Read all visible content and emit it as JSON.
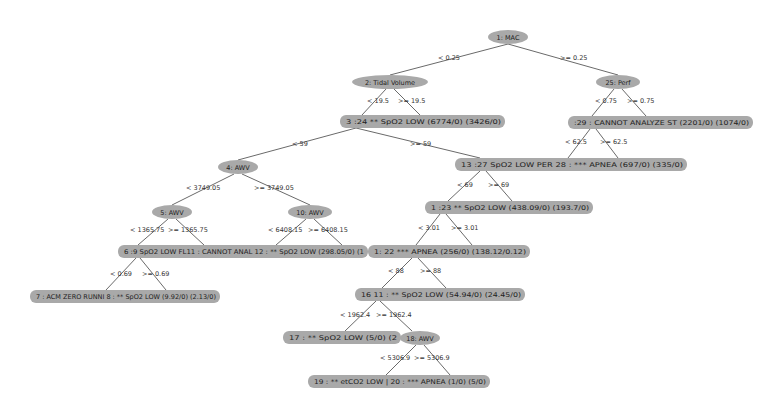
{
  "colors": {
    "node_fill": "#a9a9a9",
    "edge": "#6a6a6a",
    "background": "#ffffff"
  },
  "tree": {
    "internal_nodes": [
      {
        "id": "n1",
        "label": "1: MAC",
        "cx": 508,
        "cy": 37,
        "rx": 20,
        "ry": 7
      },
      {
        "id": "n2",
        "label": "2: Tidal Volume",
        "cx": 390,
        "cy": 82,
        "rx": 38,
        "ry": 7
      },
      {
        "id": "n25",
        "label": "25: Perf",
        "cx": 618,
        "cy": 82,
        "rx": 22,
        "ry": 7
      },
      {
        "id": "n4",
        "label": "4: AWV",
        "cx": 238,
        "cy": 167,
        "rx": 20,
        "ry": 7
      },
      {
        "id": "n5",
        "label": "5: AWV",
        "cx": 172,
        "cy": 212,
        "rx": 20,
        "ry": 7
      },
      {
        "id": "n10",
        "label": "10: AWV",
        "cx": 310,
        "cy": 212,
        "rx": 22,
        "ry": 7
      },
      {
        "id": "n18",
        "label": "18: AWV",
        "cx": 420,
        "cy": 338,
        "rx": 20,
        "ry": 7
      }
    ],
    "leaf_bars": [
      {
        "id": "b3",
        "text": "3  :24  ** SpO2    LOW        (6774/0) (3426/0)",
        "x": 340,
        "y": 115,
        "w": 165,
        "h": 13
      },
      {
        "id": "b29",
        "text": ":29 : CANNOT ANALYZE ST   (2201/0) (1074/0)",
        "x": 568,
        "y": 116,
        "w": 185,
        "h": 13
      },
      {
        "id": "b13",
        "text": "13  :27  SpO2    LOW PER 28 : *** APNEA         (697/0) (335/0)",
        "x": 455,
        "y": 158,
        "w": 232,
        "h": 13
      },
      {
        "id": "b23",
        "text": "1  :23  ** SpO2    LOW        (438.09/0) (193.7/0)",
        "x": 425,
        "y": 201,
        "w": 168,
        "h": 13
      },
      {
        "id": "b6",
        "text": "6  :9  SpO2   LOW FL11 : CANNOT ANAL 12 : ** SpO2   LOW      (298.05/0) (1",
        "x": 118,
        "y": 245,
        "w": 250,
        "h": 13
      },
      {
        "id": "b21",
        "text": "1: 22  *** APNEA             (256/0) (138.12/0.12)",
        "x": 368,
        "y": 245,
        "w": 162,
        "h": 13
      },
      {
        "id": "b7",
        "text": "7 : ACM ZERO RUNNI 8 : ** SpO2    LOW        (9.92/0) (2.13/0)",
        "x": 30,
        "y": 290,
        "w": 190,
        "h": 13
      },
      {
        "id": "b16",
        "text": "16  11 : ** SpO2    LOW        (54.94/0) (24.45/0)",
        "x": 355,
        "y": 288,
        "w": 170,
        "h": 13
      },
      {
        "id": "b17",
        "text": "17 : ** SpO2   LOW       (5/0) (2",
        "x": 283,
        "y": 331,
        "w": 118,
        "h": 13
      },
      {
        "id": "b19",
        "text": "19 : ** etCO2  LOW     | 20 : *** APNEA         (1/0) (5/0)",
        "x": 308,
        "y": 375,
        "w": 182,
        "h": 13
      }
    ],
    "edges": [
      {
        "x1": 508,
        "y1": 44,
        "x2": 390,
        "y2": 75,
        "label": "< 0.25",
        "lx": 438,
        "ly": 60
      },
      {
        "x1": 508,
        "y1": 44,
        "x2": 618,
        "y2": 75,
        "label": ">= 0.25",
        "lx": 560,
        "ly": 60
      },
      {
        "x1": 386,
        "y1": 89,
        "x2": 362,
        "y2": 115,
        "label": "< 19.5",
        "lx": 367,
        "ly": 103
      },
      {
        "x1": 394,
        "y1": 89,
        "x2": 420,
        "y2": 115,
        "label": ">= 19.5",
        "lx": 398,
        "ly": 103
      },
      {
        "x1": 614,
        "y1": 89,
        "x2": 592,
        "y2": 116,
        "label": "< 0.75",
        "lx": 595,
        "ly": 103
      },
      {
        "x1": 622,
        "y1": 89,
        "x2": 646,
        "y2": 116,
        "label": ">= 0.75",
        "lx": 627,
        "ly": 103
      },
      {
        "x1": 590,
        "y1": 129,
        "x2": 568,
        "y2": 158,
        "label": "< 62.5",
        "lx": 565,
        "ly": 144
      },
      {
        "x1": 596,
        "y1": 129,
        "x2": 618,
        "y2": 158,
        "label": ">= 62.5",
        "lx": 600,
        "ly": 144
      },
      {
        "x1": 356,
        "y1": 128,
        "x2": 238,
        "y2": 160,
        "label": "< 59",
        "lx": 292,
        "ly": 146
      },
      {
        "x1": 356,
        "y1": 128,
        "x2": 480,
        "y2": 158,
        "label": ">= 59",
        "lx": 410,
        "ly": 146
      },
      {
        "x1": 234,
        "y1": 174,
        "x2": 172,
        "y2": 205,
        "label": "< 3749.05",
        "lx": 186,
        "ly": 190
      },
      {
        "x1": 242,
        "y1": 174,
        "x2": 310,
        "y2": 205,
        "label": ">= 3749.05",
        "lx": 254,
        "ly": 190
      },
      {
        "x1": 480,
        "y1": 171,
        "x2": 448,
        "y2": 201,
        "label": "< 69",
        "lx": 457,
        "ly": 187
      },
      {
        "x1": 486,
        "y1": 171,
        "x2": 512,
        "y2": 201,
        "label": ">= 69",
        "lx": 488,
        "ly": 187
      },
      {
        "x1": 168,
        "y1": 219,
        "x2": 138,
        "y2": 245,
        "label": "< 1365.75",
        "lx": 130,
        "ly": 232
      },
      {
        "x1": 176,
        "y1": 219,
        "x2": 204,
        "y2": 245,
        "label": ">= 1365.75",
        "lx": 168,
        "ly": 232
      },
      {
        "x1": 306,
        "y1": 219,
        "x2": 276,
        "y2": 245,
        "label": "< 6408.15",
        "lx": 268,
        "ly": 232
      },
      {
        "x1": 314,
        "y1": 219,
        "x2": 342,
        "y2": 245,
        "label": ">= 6408.15",
        "lx": 308,
        "ly": 232
      },
      {
        "x1": 440,
        "y1": 214,
        "x2": 416,
        "y2": 245,
        "label": "< 3.01",
        "lx": 418,
        "ly": 230
      },
      {
        "x1": 446,
        "y1": 214,
        "x2": 472,
        "y2": 245,
        "label": ">= 3.01",
        "lx": 451,
        "ly": 230
      },
      {
        "x1": 136,
        "y1": 258,
        "x2": 106,
        "y2": 290,
        "label": "< 0.69",
        "lx": 110,
        "ly": 276
      },
      {
        "x1": 140,
        "y1": 258,
        "x2": 166,
        "y2": 290,
        "label": ">= 0.69",
        "lx": 142,
        "ly": 276
      },
      {
        "x1": 412,
        "y1": 258,
        "x2": 382,
        "y2": 288,
        "label": "< 88",
        "lx": 388,
        "ly": 273
      },
      {
        "x1": 418,
        "y1": 258,
        "x2": 446,
        "y2": 288,
        "label": ">= 88",
        "lx": 420,
        "ly": 273
      },
      {
        "x1": 376,
        "y1": 301,
        "x2": 345,
        "y2": 331,
        "label": "< 1962.4",
        "lx": 340,
        "ly": 317
      },
      {
        "x1": 380,
        "y1": 301,
        "x2": 412,
        "y2": 331,
        "label": ">= 1962.4",
        "lx": 376,
        "ly": 317
      },
      {
        "x1": 416,
        "y1": 345,
        "x2": 386,
        "y2": 375,
        "label": "< 5306.9",
        "lx": 380,
        "ly": 360
      },
      {
        "x1": 424,
        "y1": 345,
        "x2": 450,
        "y2": 375,
        "label": ">= 5306.9",
        "lx": 414,
        "ly": 360
      }
    ]
  }
}
